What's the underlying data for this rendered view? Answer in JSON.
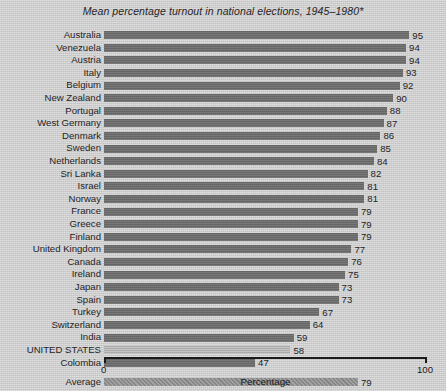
{
  "chart_data": {
    "type": "bar",
    "orientation": "horizontal",
    "title": "Mean percentage turnout in national elections, 1945–1980*",
    "xlabel": "Percentage",
    "ylabel": "",
    "xlim": [
      0,
      100
    ],
    "grid": false,
    "legend": null,
    "xticks": [
      "0",
      "100"
    ],
    "xtick_values": [
      0,
      100
    ],
    "categories": [
      "Australia",
      "Venezuela",
      "Austria",
      "Italy",
      "Belgium",
      "New Zealand",
      "Portugal",
      "West Germany",
      "Denmark",
      "Sweden",
      "Netherlands",
      "Sri Lanka",
      "Israel",
      "Norway",
      "France",
      "Greece",
      "Finland",
      "United Kingdom",
      "Canada",
      "Ireland",
      "Japan",
      "Spain",
      "Turkey",
      "Switzerland",
      "India",
      "UNITED STATES",
      "Colombia",
      "Average"
    ],
    "values": [
      95,
      94,
      94,
      93,
      92,
      90,
      88,
      87,
      86,
      85,
      84,
      82,
      81,
      81,
      79,
      79,
      79,
      77,
      76,
      75,
      73,
      73,
      67,
      64,
      59,
      58,
      47,
      79
    ],
    "bar_styles": [
      "normal",
      "normal",
      "normal",
      "normal",
      "normal",
      "normal",
      "normal",
      "normal",
      "normal",
      "normal",
      "normal",
      "normal",
      "normal",
      "normal",
      "normal",
      "normal",
      "normal",
      "normal",
      "normal",
      "normal",
      "normal",
      "normal",
      "normal",
      "normal",
      "normal",
      "light",
      "normal",
      "screened"
    ],
    "gap_before": [
      false,
      false,
      false,
      false,
      false,
      false,
      false,
      false,
      false,
      false,
      false,
      false,
      false,
      false,
      false,
      false,
      false,
      false,
      false,
      false,
      false,
      false,
      false,
      false,
      false,
      false,
      false,
      true
    ],
    "colors": {
      "background": "#d4d4d4",
      "bar": "#6e6e6e",
      "bar_highlight": "#b4b4b4",
      "bar_average": "#8d8d8d",
      "text": "#1b1b1b",
      "axis": "#1b1b1b"
    }
  }
}
